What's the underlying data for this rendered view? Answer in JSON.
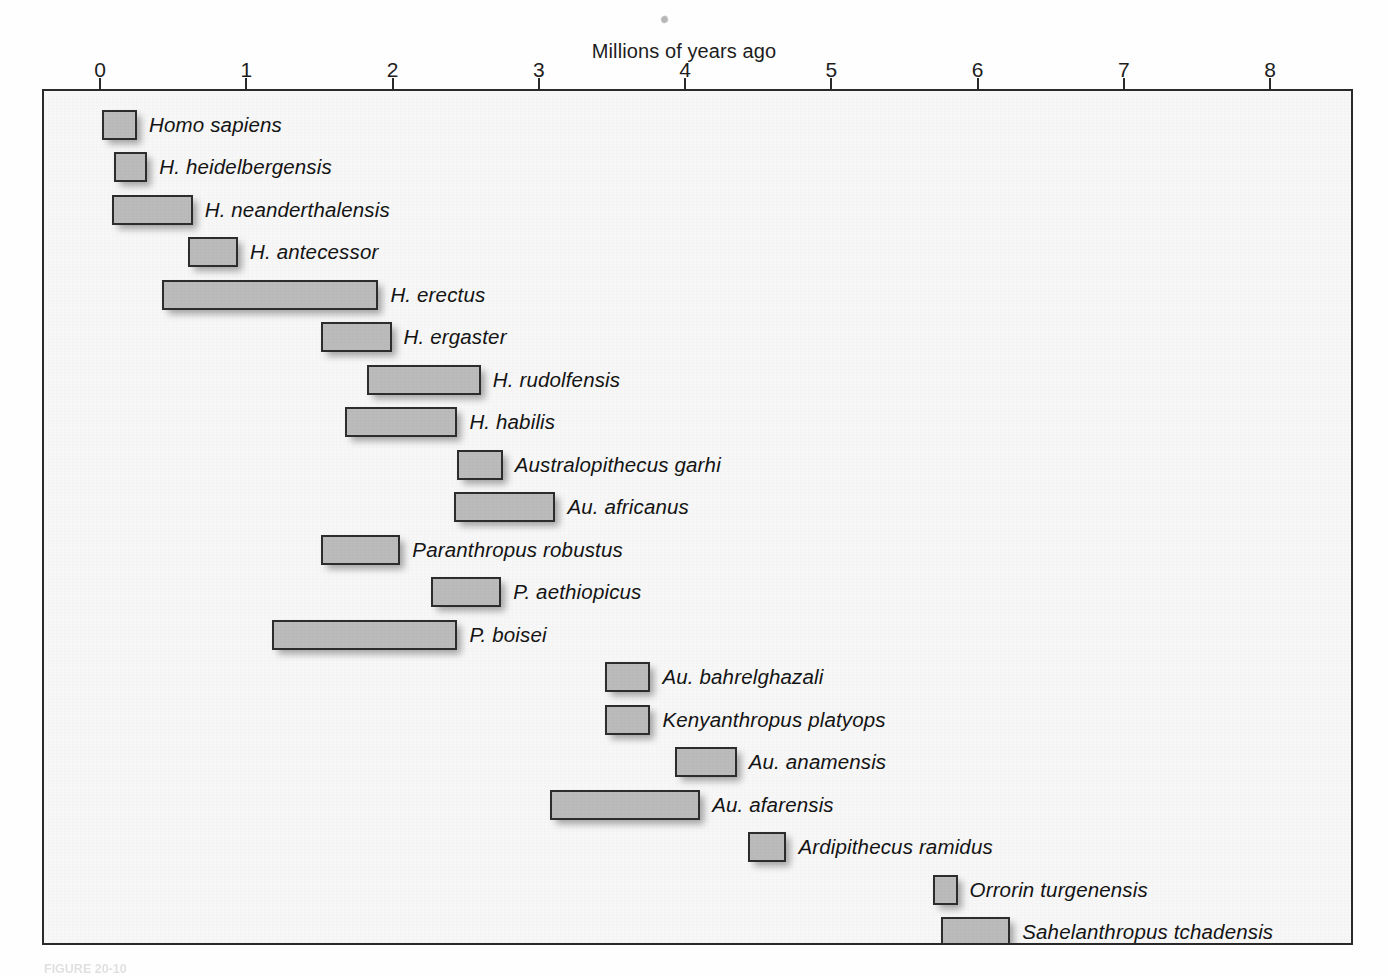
{
  "figure": {
    "axis_title": "Millions of years ago",
    "caption": "FIGURE 20-10",
    "bar_fill_color": "#bbbbbb",
    "bar_border_color": "#2d2d2d",
    "plot_background_color": "#f7f7f7",
    "frame_color": "#2a2a2a"
  },
  "chart_data": {
    "type": "bar",
    "title": "",
    "xlabel": "Millions of years ago",
    "ylabel": "",
    "xlim": [
      0,
      8.6
    ],
    "xticks": [
      0,
      1,
      2,
      3,
      4,
      5,
      6,
      7,
      8
    ],
    "xtick_labels": [
      "0",
      "1",
      "2",
      "3",
      "4",
      "5",
      "6",
      "7",
      "8"
    ],
    "axis_position": "top",
    "grid": false,
    "legend": "none",
    "orientation": "horizontal-range",
    "units": "Ma (millions of years ago)",
    "categories": [
      "Homo sapiens",
      "H. heidelbergensis",
      "H. neanderthalensis",
      "H. antecessor",
      "H. erectus",
      "H. ergaster",
      "H. rudolfensis",
      "H. habilis",
      "Australopithecus garhi",
      "Au. africanus",
      "Paranthropus robustus",
      "P. aethiopicus",
      "P. boisei",
      "Au. bahrelghazali",
      "Kenyanthropus platyops",
      "Au. anamensis",
      "Au. afarensis",
      "Ardipithecus ramidus",
      "Orrorin turgenensis",
      "Sahelanthropus tchadensis"
    ],
    "ranges": [
      {
        "name": "Homo sapiens",
        "start": 0.0,
        "end": 0.24
      },
      {
        "name": "H. heidelbergensis",
        "start": 0.08,
        "end": 0.31
      },
      {
        "name": "H. neanderthalensis",
        "start": 0.07,
        "end": 0.62
      },
      {
        "name": "H. antecessor",
        "start": 0.59,
        "end": 0.93
      },
      {
        "name": "H. erectus",
        "start": 0.41,
        "end": 1.89
      },
      {
        "name": "H. ergaster",
        "start": 1.5,
        "end": 1.98
      },
      {
        "name": "H. rudolfensis",
        "start": 1.81,
        "end": 2.59
      },
      {
        "name": "H. habilis",
        "start": 1.66,
        "end": 2.43
      },
      {
        "name": "Australopithecus garhi",
        "start": 2.43,
        "end": 2.74
      },
      {
        "name": "Au. africanus",
        "start": 2.41,
        "end": 3.1
      },
      {
        "name": "Paranthropus robustus",
        "start": 1.5,
        "end": 2.04
      },
      {
        "name": "P. aethiopicus",
        "start": 2.25,
        "end": 2.73
      },
      {
        "name": "P. boisei",
        "start": 1.16,
        "end": 2.43
      },
      {
        "name": "Au. bahrelghazali",
        "start": 3.44,
        "end": 3.75
      },
      {
        "name": "Kenyanthropus platyops",
        "start": 3.44,
        "end": 3.75
      },
      {
        "name": "Au. anamensis",
        "start": 3.92,
        "end": 4.34
      },
      {
        "name": "Au. afarensis",
        "start": 3.06,
        "end": 4.09
      },
      {
        "name": "Ardipithecus ramidus",
        "start": 4.42,
        "end": 4.68
      },
      {
        "name": "Orrorin turgenensis",
        "start": 5.68,
        "end": 5.85
      },
      {
        "name": "Sahelanthropus tchadensis",
        "start": 5.74,
        "end": 6.21
      }
    ]
  },
  "layout": {
    "px_per_ma": 146.25,
    "x_origin_px": 100,
    "plot_left_px": 42,
    "plot_top_px": 89,
    "row_first_top_px": 107.5,
    "row_spacing_px": 42.5,
    "bar_height_px": 30,
    "label_gap_px": 12
  }
}
